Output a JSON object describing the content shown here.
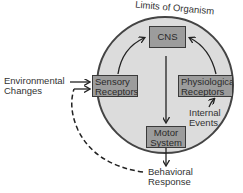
{
  "title": "Limits of Organism",
  "nodes": {
    "cns": {
      "label": "CNS"
    },
    "sensory": {
      "line1": "Sensory",
      "line2": "Receptors"
    },
    "physio": {
      "line1": "Physiological",
      "line2": "Receptors"
    },
    "motor": {
      "line1": "Motor",
      "line2": "System"
    }
  },
  "external_labels": {
    "environmental": {
      "line1": "Environmental",
      "line2": "Changes"
    },
    "internal": {
      "line1": "Internal",
      "line2": "Events"
    },
    "behavioral": {
      "line1": "Behavioral",
      "line2": "Response"
    }
  },
  "colors": {
    "organism_fill": "#dcdcdc",
    "organism_stroke": "#444444",
    "box_fill": "#9c9c9c",
    "line": "#222222"
  }
}
